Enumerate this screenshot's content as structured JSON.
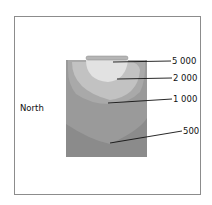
{
  "diagram": {
    "orientation_label": "North",
    "contours": [
      {
        "label": "5 000",
        "color": "#e2e2e2"
      },
      {
        "label": "2 000",
        "color": "#c2c2c2"
      },
      {
        "label": "1 000",
        "color": "#a9a9a9"
      },
      {
        "label": "500",
        "color": "#9a9a9a"
      }
    ],
    "background_zone_color": "#8b8b8b",
    "fixture_color": "#b5b5b5"
  }
}
